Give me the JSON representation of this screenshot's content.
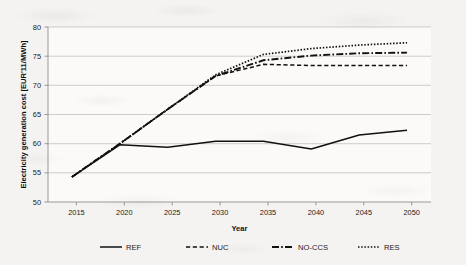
{
  "chart_data": {
    "type": "line",
    "title": "",
    "xlabel": "Year",
    "ylabel": "Electricity generation cost [EUR'11/MWh]",
    "x": [
      2015,
      2020,
      2025,
      2030,
      2035,
      2040,
      2045,
      2050
    ],
    "categories": [
      "2015",
      "2020",
      "2025",
      "2030",
      "2035",
      "2040",
      "2045",
      "2050"
    ],
    "xlim": [
      2012.5,
      2052.5
    ],
    "ylim": [
      50,
      80
    ],
    "ytick_values": [
      50,
      55,
      60,
      65,
      70,
      75,
      80
    ],
    "ytick_labels": [
      "50",
      "55",
      "60",
      "65",
      "70",
      "75",
      "80"
    ],
    "xtick_labels": [
      "2015",
      "2020",
      "2025",
      "2030",
      "2035",
      "2040",
      "2045",
      "2050"
    ],
    "grid": "horizontal",
    "legend_position": "bottom",
    "series": [
      {
        "name": "REF",
        "dash": "solid",
        "color": "#111111",
        "values": [
          54.3,
          59.8,
          59.4,
          60.4,
          60.4,
          59.1,
          61.5,
          62.3
        ]
      },
      {
        "name": "NUC",
        "dash": "dashed",
        "color": "#111111",
        "values": [
          54.3,
          60.0,
          65.9,
          71.6,
          73.6,
          73.4,
          73.4,
          73.4
        ]
      },
      {
        "name": "NO-CCS",
        "dash": "dash-dot",
        "color": "#111111",
        "values": [
          54.3,
          60.0,
          65.9,
          71.6,
          74.3,
          75.1,
          75.5,
          75.6
        ]
      },
      {
        "name": "RES",
        "dash": "dotted",
        "color": "#111111",
        "values": [
          54.3,
          60.0,
          65.9,
          71.8,
          75.3,
          76.3,
          76.9,
          77.3
        ]
      }
    ]
  },
  "legend": {
    "items": [
      {
        "label": "REF"
      },
      {
        "label": "NUC"
      },
      {
        "label": "NO-CCS"
      },
      {
        "label": "RES"
      }
    ]
  },
  "axes": {
    "y_title": "Electricity generation cost [EUR'11/MWh]",
    "x_title": "Year"
  }
}
